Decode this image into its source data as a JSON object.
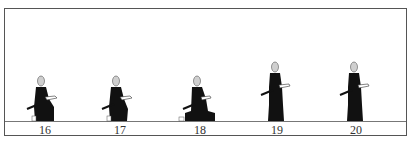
{
  "diagram": {
    "type": "sequence-of-poses",
    "frames": [
      {
        "label": "16",
        "pose": "kneeling",
        "x": 40
      },
      {
        "label": "17",
        "pose": "kneeling",
        "x": 115
      },
      {
        "label": "18",
        "pose": "seated-cross",
        "x": 195
      },
      {
        "label": "19",
        "pose": "standing",
        "x": 272
      },
      {
        "label": "20",
        "pose": "standing",
        "x": 351
      }
    ]
  },
  "colors": {
    "figure": "#111111",
    "head": "#cfcfcf",
    "border": "#555555"
  }
}
